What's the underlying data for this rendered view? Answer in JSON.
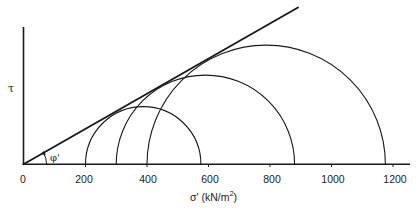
{
  "diagram": {
    "type": "mohr-coulomb-failure-envelope",
    "y_axis_label": "τ",
    "x_axis_label": "σ' (kN/m",
    "x_axis_label_superscript": "2",
    "x_axis_label_close": ")",
    "angle_label": "φ'",
    "x_ticks": [
      "0",
      "200",
      "400",
      "600",
      "800",
      "1000",
      "1200"
    ],
    "x_tick_values": [
      0,
      200,
      400,
      600,
      800,
      1000,
      1200
    ],
    "x_range": [
      0,
      1240
    ],
    "mohr_circles": [
      {
        "sigma3": 200,
        "sigma1": 575
      },
      {
        "sigma3": 300,
        "sigma1": 880
      },
      {
        "sigma3": 400,
        "sigma1": 1175
      }
    ],
    "failure_envelope": {
      "cohesion": 0,
      "phi_deg": 29.7
    },
    "colors": {
      "line": "#1a1a1a",
      "background": "#ffffff"
    }
  }
}
